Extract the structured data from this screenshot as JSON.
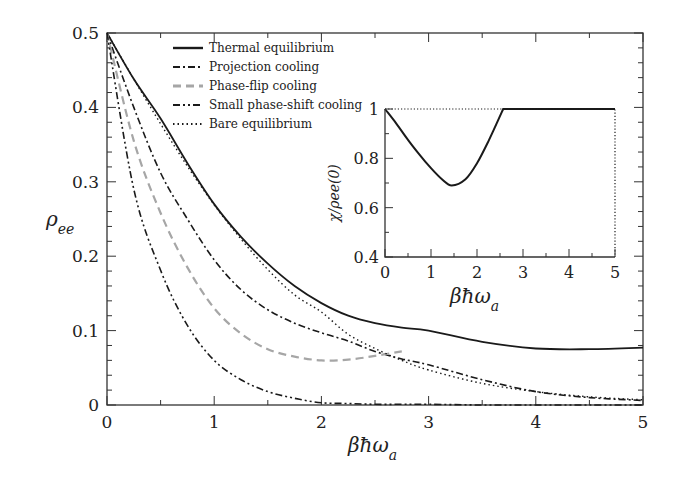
{
  "chart_data": [
    {
      "type": "line",
      "title": "",
      "xlabel": "βħω_a",
      "ylabel": "ρ_ee",
      "xlim": [
        0,
        5
      ],
      "ylim": [
        0,
        0.5
      ],
      "xticks": [
        "0",
        "1",
        "2",
        "3",
        "4",
        "5"
      ],
      "yticks": [
        "0",
        "0.1",
        "0.2",
        "0.3",
        "0.4",
        "0.5"
      ],
      "grid": false,
      "legend_position": "upper center",
      "x": [
        0,
        0.25,
        0.5,
        0.75,
        1,
        1.25,
        1.5,
        1.75,
        2,
        2.25,
        2.5,
        2.75,
        3,
        3.5,
        4,
        4.5,
        5
      ],
      "series": [
        {
          "name": "Thermal equilibrium",
          "style": "solid",
          "color": "#1a1a1a",
          "values": [
            0.5,
            0.438,
            0.385,
            0.325,
            0.27,
            0.226,
            0.19,
            0.16,
            0.137,
            0.12,
            0.11,
            0.104,
            0.1,
            0.085,
            0.076,
            0.075,
            0.077
          ]
        },
        {
          "name": "Projection cooling",
          "style": "dashdot",
          "color": "#1a1a1a",
          "values": [
            0.5,
            0.4,
            0.312,
            0.25,
            0.195,
            0.155,
            0.128,
            0.11,
            0.097,
            0.086,
            0.072,
            0.062,
            0.054,
            0.034,
            0.018,
            0.01,
            0.006
          ]
        },
        {
          "name": "Phase-flip cooling",
          "style": "dashed",
          "color": "#a6a6a6",
          "values": [
            0.5,
            0.355,
            0.258,
            0.185,
            0.13,
            0.096,
            0.075,
            0.065,
            0.06,
            0.061,
            0.066,
            0.072,
            null,
            null,
            null,
            null,
            null
          ]
        },
        {
          "name": "Small phase-shift cooling",
          "style": "dashdotdot",
          "color": "#1a1a1a",
          "values": [
            0.5,
            0.29,
            0.181,
            0.107,
            0.06,
            0.034,
            0.018,
            0.009,
            0.003,
            0.002,
            0.001,
            0.001,
            0.001,
            0.0,
            0.0,
            0.0,
            0.0
          ]
        },
        {
          "name": "Bare equilibrium",
          "style": "dotted",
          "color": "#1a1a1a",
          "values": [
            0.5,
            0.438,
            0.378,
            0.321,
            0.269,
            0.223,
            0.182,
            0.148,
            0.125,
            0.095,
            0.076,
            0.06,
            0.047,
            0.029,
            0.018,
            0.011,
            0.007
          ]
        }
      ]
    },
    {
      "type": "line",
      "title": "inset",
      "xlabel": "βħω_a",
      "ylabel": "χ/ρ_ee(0)",
      "xlim": [
        0,
        5
      ],
      "ylim": [
        0.4,
        1
      ],
      "xticks": [
        "0",
        "1",
        "2",
        "3",
        "4",
        "5"
      ],
      "yticks": [
        "0.4",
        "0.6",
        "0.8",
        "1"
      ],
      "grid": false,
      "x": [
        0,
        0.25,
        0.5,
        0.75,
        1,
        1.25,
        1.45,
        1.75,
        2,
        2.25,
        2.57,
        3,
        4,
        5
      ],
      "series": [
        {
          "name": "χ/ρee(0)",
          "style": "solid",
          "color": "#1a1a1a",
          "values": [
            1.0,
            0.94,
            0.875,
            0.815,
            0.76,
            0.713,
            0.69,
            0.715,
            0.78,
            0.87,
            1.0,
            1.0,
            1.0,
            1.0
          ]
        },
        {
          "name": "reference",
          "style": "dotted",
          "color": "#1a1a1a",
          "values": [
            1.0,
            1.0,
            1.0,
            1.0,
            1.0,
            1.0,
            1.0,
            1.0,
            1.0,
            1.0,
            1.0,
            1.0,
            1.0,
            1.0
          ]
        }
      ]
    }
  ],
  "main": {
    "xlabel_base": "βħω",
    "xlabel_sub": "a",
    "ylabel_base": "ρ",
    "ylabel_sub": "ee",
    "legend": [
      {
        "label": "Thermal equilibrium",
        "style": "solid"
      },
      {
        "label": "Projection cooling",
        "style": "dashdot"
      },
      {
        "label": "Phase-flip cooling",
        "style": "dashed"
      },
      {
        "label": "Small phase-shift cooling",
        "style": "dashdotdot"
      },
      {
        "label": "Bare equilibrium",
        "style": "dotted"
      }
    ]
  },
  "inset": {
    "xlabel_base": "βħω",
    "xlabel_sub": "a",
    "ylabel": "χ/ρee(0)"
  }
}
